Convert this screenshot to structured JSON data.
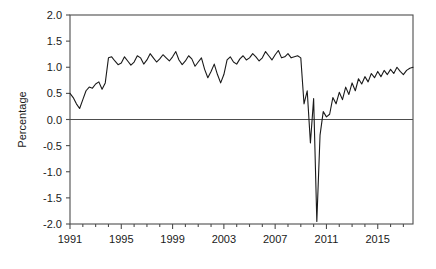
{
  "chart_data": {
    "type": "line",
    "title": "",
    "xlabel": "",
    "ylabel": "Percentage",
    "xlim": [
      1991,
      2017.75
    ],
    "ylim": [
      -2.0,
      2.0
    ],
    "grid": false,
    "legend": false,
    "zero_line": true,
    "line_color": "#1a1a1a",
    "axis_color": "#4d4d4d",
    "background": "#ffffff",
    "y_ticks": [
      -2.0,
      -1.5,
      -1.0,
      -0.5,
      0.0,
      0.5,
      1.0,
      1.5,
      2.0
    ],
    "y_tick_labels": [
      "-2.0",
      "-1.5",
      "-1.0",
      "-0.5",
      "0.0",
      "0.5",
      "1.0",
      "1.5",
      "2.0"
    ],
    "x_ticks": [
      1991,
      1995,
      1999,
      2003,
      2007,
      2011,
      2015
    ],
    "x_tick_labels": [
      "1991",
      "1995",
      "1999",
      "2003",
      "2007",
      "2011",
      "2015"
    ],
    "x_minor_step": 1,
    "series": [
      {
        "name": "Percentage",
        "x": [
          1991.0,
          1991.25,
          1991.5,
          1991.75,
          1992.0,
          1992.25,
          1992.5,
          1992.75,
          1993.0,
          1993.25,
          1993.5,
          1993.75,
          1994.0,
          1994.25,
          1994.5,
          1994.75,
          1995.0,
          1995.25,
          1995.5,
          1995.75,
          1996.0,
          1996.25,
          1996.5,
          1996.75,
          1997.0,
          1997.25,
          1997.5,
          1997.75,
          1998.0,
          1998.25,
          1998.5,
          1998.75,
          1999.0,
          1999.25,
          1999.5,
          1999.75,
          2000.0,
          2000.25,
          2000.5,
          2000.75,
          2001.0,
          2001.25,
          2001.5,
          2001.75,
          2002.0,
          2002.25,
          2002.5,
          2002.75,
          2003.0,
          2003.25,
          2003.5,
          2003.75,
          2004.0,
          2004.25,
          2004.5,
          2004.75,
          2005.0,
          2005.25,
          2005.5,
          2005.75,
          2006.0,
          2006.25,
          2006.5,
          2006.75,
          2007.0,
          2007.25,
          2007.5,
          2007.75,
          2008.0,
          2008.25,
          2008.5,
          2008.75,
          2009.0,
          2009.25,
          2009.5,
          2009.75,
          2010.0,
          2010.25,
          2010.5,
          2010.75,
          2011.0,
          2011.25,
          2011.5,
          2011.75,
          2012.0,
          2012.25,
          2012.5,
          2012.75,
          2013.0,
          2013.25,
          2013.5,
          2013.75,
          2014.0,
          2014.25,
          2014.5,
          2014.75,
          2015.0,
          2015.25,
          2015.5,
          2015.75,
          2016.0,
          2016.25,
          2016.5,
          2016.75,
          2017.0,
          2017.25,
          2017.5,
          2017.75
        ],
        "values": [
          0.5,
          0.42,
          0.3,
          0.21,
          0.38,
          0.55,
          0.62,
          0.6,
          0.68,
          0.72,
          0.58,
          0.7,
          1.18,
          1.2,
          1.12,
          1.05,
          1.08,
          1.2,
          1.12,
          1.04,
          1.1,
          1.22,
          1.18,
          1.06,
          1.14,
          1.26,
          1.18,
          1.1,
          1.16,
          1.24,
          1.18,
          1.12,
          1.2,
          1.3,
          1.14,
          1.05,
          1.12,
          1.22,
          1.16,
          1.02,
          1.1,
          1.18,
          0.96,
          0.8,
          0.92,
          1.06,
          0.86,
          0.7,
          0.86,
          1.14,
          1.2,
          1.1,
          1.06,
          1.16,
          1.22,
          1.14,
          1.18,
          1.26,
          1.2,
          1.12,
          1.18,
          1.3,
          1.22,
          1.14,
          1.24,
          1.32,
          1.18,
          1.2,
          1.26,
          1.18,
          1.2,
          1.22,
          1.18,
          0.3,
          0.55,
          -0.45,
          0.4,
          -1.95,
          -0.3,
          0.15,
          0.05,
          0.1,
          0.42,
          0.3,
          0.52,
          0.38,
          0.62,
          0.48,
          0.7,
          0.55,
          0.78,
          0.68,
          0.82,
          0.72,
          0.88,
          0.8,
          0.92,
          0.82,
          0.94,
          0.86,
          0.96,
          0.88,
          1.0,
          0.92,
          0.86,
          0.94,
          0.98,
          1.0
        ]
      }
    ]
  }
}
